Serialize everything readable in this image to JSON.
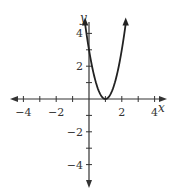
{
  "chart_data": {
    "type": "line",
    "title": "",
    "xlabel": "x",
    "ylabel": "y",
    "xlim": [
      -5,
      5
    ],
    "ylim": [
      -5,
      5
    ],
    "grid": false,
    "x_tick_labels": [
      "-4",
      "-2",
      "2",
      "4"
    ],
    "y_tick_labels": [
      "4",
      "2",
      "-2",
      "-4"
    ],
    "series": [
      {
        "name": "parabola",
        "equation": "y = 3(x - 1)^2",
        "vertex": [
          1,
          0
        ],
        "y_intercept": 3,
        "x": [
          -0.2,
          0,
          0.25,
          0.5,
          0.75,
          1,
          1.25,
          1.5,
          1.75,
          2,
          2.2
        ],
        "values": [
          4.32,
          3,
          1.69,
          0.75,
          0.19,
          0,
          0.19,
          0.75,
          1.69,
          3,
          4.32
        ]
      }
    ]
  },
  "axes": {
    "x_label": "x",
    "y_label": "y",
    "x_ticks": [
      {
        "value": -4,
        "label": "−4"
      },
      {
        "value": -2,
        "label": "−2"
      },
      {
        "value": 2,
        "label": "2"
      },
      {
        "value": 4,
        "label": "4"
      }
    ],
    "y_ticks": [
      {
        "value": 4,
        "label": "4"
      },
      {
        "value": 2,
        "label": "2"
      },
      {
        "value": -2,
        "label": "−2"
      },
      {
        "value": -4,
        "label": "−4"
      }
    ]
  },
  "colors": {
    "axis": "#333333",
    "curve": "#222222"
  }
}
